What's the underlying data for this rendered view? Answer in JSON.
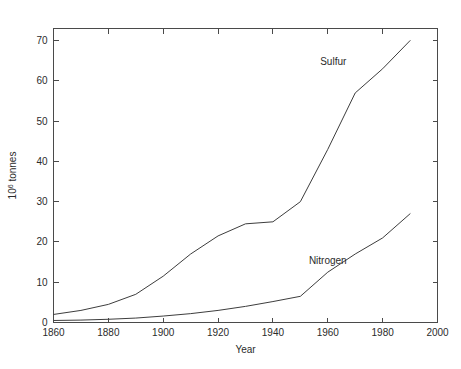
{
  "chart_data": {
    "type": "line",
    "title": "",
    "xlabel": "Year",
    "ylabel": "10^6 tonnes",
    "ylabel_base": "10",
    "ylabel_exponent": "6",
    "ylabel_unit": " tonnes",
    "xlim": [
      1860,
      2000
    ],
    "ylim": [
      0,
      73
    ],
    "xticks": [
      1860,
      1880,
      1900,
      1920,
      1940,
      1960,
      1980,
      2000
    ],
    "xtick_labels": [
      "1860",
      "1880",
      "1900",
      "1920",
      "1940",
      "1960",
      "1980",
      "2000"
    ],
    "yticks": [
      0,
      10,
      20,
      30,
      40,
      50,
      60,
      70
    ],
    "ytick_labels": [
      "0",
      "10",
      "20",
      "30",
      "40",
      "50",
      "60",
      "70"
    ],
    "grid": false,
    "legend": "inline-annotations",
    "series": [
      {
        "name": "Sulfur",
        "label": "Sulfur",
        "color": "#3d3d3d",
        "label_x": 1962,
        "label_y": 64,
        "x": [
          1860,
          1870,
          1880,
          1890,
          1900,
          1910,
          1920,
          1930,
          1940,
          1950,
          1960,
          1970,
          1980,
          1990
        ],
        "y": [
          2.0,
          3.0,
          4.5,
          7.0,
          11.5,
          17.0,
          21.5,
          24.5,
          25.0,
          30.0,
          43.0,
          57.0,
          63.0,
          70.0
        ]
      },
      {
        "name": "Nitrogen",
        "label": "Nitrogen",
        "color": "#3d3d3d",
        "label_x": 1960,
        "label_y": 14.5,
        "x": [
          1860,
          1870,
          1880,
          1890,
          1900,
          1910,
          1920,
          1930,
          1940,
          1950,
          1960,
          1970,
          1980,
          1990
        ],
        "y": [
          0.5,
          0.6,
          0.8,
          1.1,
          1.6,
          2.2,
          3.0,
          4.0,
          5.2,
          6.5,
          12.5,
          17.0,
          21.0,
          27.0
        ]
      }
    ]
  }
}
